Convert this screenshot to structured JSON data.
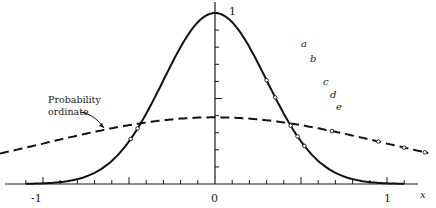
{
  "diagram": {
    "type": "line",
    "title": "",
    "x_axis": {
      "label": "x",
      "ticks": [
        "-1",
        "0",
        "1"
      ],
      "range": [
        -1.25,
        1.25
      ],
      "minor_step": 0.1
    },
    "y_axis": {
      "peak_label": "1",
      "minor_step": 0.1
    },
    "curves": [
      {
        "name": "Solid bell curve",
        "style": "solid",
        "description": "exp(-x^2 / (2*0.3^2)) style curve, peak 1 at x=0"
      },
      {
        "name": "Probability ordinate",
        "style": "dashed",
        "description": "wide normal density, about 0.39 at x=0"
      }
    ],
    "point_labels": [
      "a",
      "b",
      "c",
      "d",
      "e"
    ],
    "annotation": {
      "line1": "Probability",
      "line2": "ordinate"
    },
    "colors": {
      "ink": "#1a1a1a",
      "background": "#ffffff"
    }
  },
  "chart_data": {
    "type": "line",
    "title": "",
    "xlabel": "x",
    "ylabel": "",
    "xlim": [
      -1.2,
      1.2
    ],
    "ylim": [
      0,
      1.05
    ],
    "x_ticks": [
      -1,
      0,
      1
    ],
    "series": [
      {
        "name": "solid curve",
        "x": [
          -1.1,
          -0.8,
          -0.6,
          -0.4,
          -0.2,
          0,
          0.2,
          0.4,
          0.6,
          0.8,
          1.1
        ],
        "values": [
          0.01,
          0.07,
          0.18,
          0.41,
          0.8,
          1.0,
          0.8,
          0.41,
          0.18,
          0.07,
          0.01
        ]
      },
      {
        "name": "Probability ordinate (dashed)",
        "x": [
          -1.25,
          -1,
          -0.5,
          0,
          0.5,
          1,
          1.25
        ],
        "values": [
          0.18,
          0.24,
          0.35,
          0.39,
          0.35,
          0.24,
          0.18
        ]
      }
    ],
    "annotations": [
      "1",
      "a",
      "b",
      "c",
      "d",
      "e",
      "Probability ordinate"
    ]
  }
}
